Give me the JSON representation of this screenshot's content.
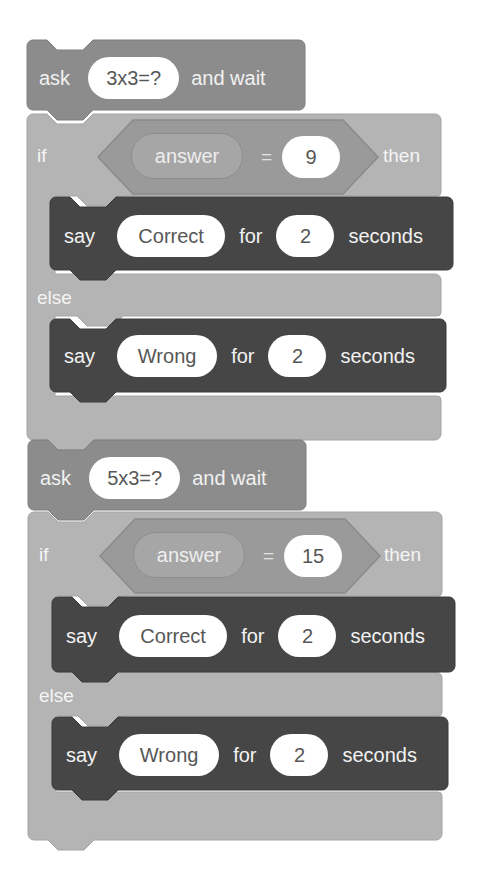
{
  "script": {
    "groups": [
      {
        "ask": {
          "keyword": "ask",
          "question": "3x3=?",
          "suffix": "and wait"
        },
        "if_else": {
          "if_label": "if",
          "condition": {
            "left": "answer",
            "operator": "=",
            "right": "9"
          },
          "then_label": "then",
          "else_label": "else",
          "then_say": {
            "keyword": "say",
            "message": "Correct",
            "for_label": "for",
            "seconds": "2",
            "unit": "seconds"
          },
          "else_say": {
            "keyword": "say",
            "message": "Wrong",
            "for_label": "for",
            "seconds": "2",
            "unit": "seconds"
          }
        }
      },
      {
        "ask": {
          "keyword": "ask",
          "question": "5x3=?",
          "suffix": "and wait"
        },
        "if_else": {
          "if_label": "if",
          "condition": {
            "left": "answer",
            "operator": "=",
            "right": "15"
          },
          "then_label": "then",
          "else_label": "else",
          "then_say": {
            "keyword": "say",
            "message": "Correct",
            "for_label": "for",
            "seconds": "2",
            "unit": "seconds"
          },
          "else_say": {
            "keyword": "say",
            "message": "Wrong",
            "for_label": "for",
            "seconds": "2",
            "unit": "seconds"
          }
        }
      }
    ]
  },
  "colors": {
    "sensing_block": "#8c8c8c",
    "control_block": "#b4b4b4",
    "operator_hex": "#9a9a9a",
    "looks_block": "#464646",
    "input_pill": "#ffffff",
    "background": "#ffffff"
  }
}
